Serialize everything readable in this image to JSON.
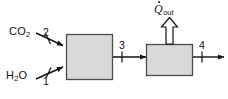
{
  "diagram": {
    "type": "process-flow-diagram",
    "background_color": "#ffffff",
    "line_color": "#111111",
    "box_fill_color": "#d9d9d9",
    "box_border_color": "#4d4d4d",
    "arrow_fill_color": "#ffffff",
    "inlets": [
      {
        "id": "co2-inlet",
        "species_text": "CO",
        "species_subscript": "2",
        "stream_number": "2",
        "direction": "down-right"
      },
      {
        "id": "h2o-inlet",
        "species_text": "H",
        "species_subscript": "2",
        "species_tail": "O",
        "stream_number": "1",
        "direction": "up-right"
      }
    ],
    "units": [
      {
        "id": "unit-left",
        "label": "",
        "shape": "square"
      },
      {
        "id": "unit-right",
        "label": "",
        "shape": "rectangle"
      }
    ],
    "internal_streams": [
      {
        "id": "stream-3",
        "stream_number": "3",
        "direction": "right"
      }
    ],
    "outlets": [
      {
        "id": "stream-4",
        "stream_number": "4",
        "direction": "right"
      }
    ],
    "heat_output": {
      "id": "q-out",
      "symbol": "Q",
      "subscript": "out",
      "overdot": true,
      "direction": "up",
      "arrow_style": "hollow-block"
    }
  }
}
